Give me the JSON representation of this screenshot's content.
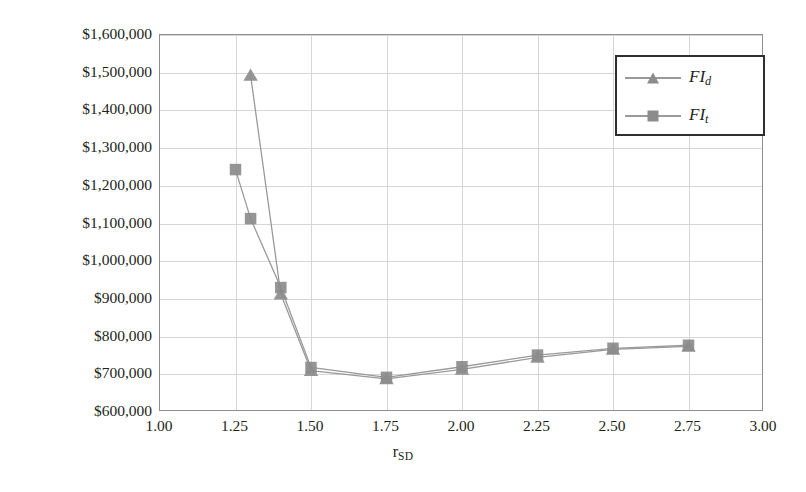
{
  "chart_data": {
    "type": "line",
    "title": "",
    "xlabel": "r_SD",
    "xlabel_base": "r",
    "xlabel_sub": "SD",
    "ylabel": "Minimum TAC ($)",
    "xlim": [
      1.0,
      3.0
    ],
    "ylim": [
      600000,
      1600000
    ],
    "xticks": [
      "1.00",
      "1.25",
      "1.50",
      "1.75",
      "2.00",
      "2.25",
      "2.50",
      "2.75",
      "3.00"
    ],
    "xtick_values": [
      1.0,
      1.25,
      1.5,
      1.75,
      2.0,
      2.25,
      2.5,
      2.75,
      3.0
    ],
    "yticks": [
      "$600,000",
      "$700,000",
      "$800,000",
      "$900,000",
      "$1,000,000",
      "$1,100,000",
      "$1,200,000",
      "$1,300,000",
      "$1,400,000",
      "$1,500,000",
      "$1,600,000"
    ],
    "ytick_values": [
      600000,
      700000,
      800000,
      900000,
      1000000,
      1100000,
      1200000,
      1300000,
      1400000,
      1500000,
      1600000
    ],
    "grid": true,
    "legend_position": "top-right",
    "series": [
      {
        "name": "FI_d",
        "label_base": "FI",
        "label_sub": "d",
        "marker": "triangle",
        "color": "#8c8c8c",
        "line_color": "#9a9a9a",
        "x": [
          1.3,
          1.4,
          1.5,
          1.75,
          2.0,
          2.25,
          2.5,
          2.75
        ],
        "values": [
          1493000,
          913000,
          710000,
          688000,
          713000,
          745000,
          766000,
          774000
        ]
      },
      {
        "name": "FI_t",
        "label_base": "FI",
        "label_sub": "t",
        "marker": "square",
        "color": "#8c8c8c",
        "line_color": "#9a9a9a",
        "x": [
          1.25,
          1.3,
          1.4,
          1.5,
          1.75,
          2.0,
          2.25,
          2.5,
          2.75
        ],
        "values": [
          1243000,
          1113000,
          930000,
          718000,
          692000,
          720000,
          751000,
          769000,
          777000
        ]
      }
    ]
  },
  "legend": {
    "items": [
      {
        "label_base": "FI",
        "label_sub": "d",
        "marker": "triangle"
      },
      {
        "label_base": "FI",
        "label_sub": "t",
        "marker": "square"
      }
    ]
  },
  "axis": {
    "y_title": "Minimum TAC ($)",
    "x_title_base": "r",
    "x_title_sub": "SD"
  }
}
